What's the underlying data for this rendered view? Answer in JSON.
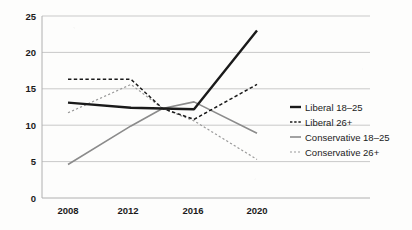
{
  "chart_data": {
    "type": "line",
    "title": "",
    "xlabel": "",
    "ylabel": "",
    "x": [
      2008,
      2010,
      2012,
      2014,
      2016,
      2018,
      2020
    ],
    "categories": [
      "2008",
      "2012",
      "2016",
      "2020"
    ],
    "xtick_labels": [
      "2008",
      "2012",
      "2016",
      "2020"
    ],
    "xtick_values": [
      2008,
      2012,
      2016,
      2020
    ],
    "ytick_labels": [
      "0",
      "5",
      "10",
      "15",
      "20",
      "25"
    ],
    "ytick_values": [
      0,
      5,
      10,
      15,
      20,
      25
    ],
    "ylim": [
      0,
      25
    ],
    "xlim": [
      2007,
      2022
    ],
    "grid": "horizontal",
    "legend_position": "right",
    "series": [
      {
        "name": "Liberal 18–25",
        "style": "solid-thick",
        "color": "#1a1a1a",
        "x": [
          2008,
          2012,
          2014,
          2016,
          2020
        ],
        "values": [
          13.1,
          12.4,
          12.3,
          12.2,
          23.0
        ]
      },
      {
        "name": "Liberal 26+",
        "style": "dashed",
        "color": "#1a1a1a",
        "x": [
          2008,
          2012,
          2014,
          2016,
          2020
        ],
        "values": [
          16.3,
          16.3,
          12.3,
          10.8,
          15.6
        ]
      },
      {
        "name": "Conservative 18–25",
        "style": "solid-thin",
        "color": "#8b8b8b",
        "x": [
          2008,
          2012,
          2014,
          2016,
          2020
        ],
        "values": [
          4.6,
          9.9,
          12.3,
          13.2,
          8.9
        ]
      },
      {
        "name": "Conservative 26+",
        "style": "dotted",
        "color": "#9a9a9a",
        "x": [
          2008,
          2012,
          2014,
          2016,
          2020
        ],
        "values": [
          11.7,
          15.6,
          12.3,
          10.6,
          5.3
        ]
      }
    ],
    "legend": [
      {
        "label": "Liberal 18–25",
        "style": "solid-thick",
        "color": "#1a1a1a"
      },
      {
        "label": "Liberal 26+",
        "style": "dashed",
        "color": "#1a1a1a"
      },
      {
        "label": "Conservative 18–25",
        "style": "solid-thin",
        "color": "#8b8b8b"
      },
      {
        "label": "Conservative 26+",
        "style": "dotted",
        "color": "#9a9a9a"
      }
    ]
  },
  "axes": {
    "y_ticks": [
      {
        "label": "25",
        "py": 16
      },
      {
        "label": "20",
        "py": 52.4
      },
      {
        "label": "15",
        "py": 88.8
      },
      {
        "label": "10",
        "py": 125.2
      },
      {
        "label": "5",
        "py": 161.6
      },
      {
        "label": "0",
        "py": 198
      }
    ],
    "x_ticks": [
      {
        "label": "2008",
        "px": 68
      },
      {
        "label": "2012",
        "px": 128
      },
      {
        "label": "2016",
        "px": 193
      },
      {
        "label": "2020",
        "px": 257
      }
    ]
  },
  "legend_rows": [
    {
      "label": "Liberal 18–25",
      "y": 110
    },
    {
      "label": "Liberal 26+",
      "y": 125
    },
    {
      "label": "Conservative 18–25",
      "y": 140
    },
    {
      "label": "Conservative 26+",
      "y": 155
    }
  ],
  "colors": {
    "ink": "#1a1a1a",
    "gray_line": "#8b8b8b",
    "gray_dotted": "#9a9a9a",
    "grid": "#c9c9c9",
    "axis": "#b0b0b0",
    "background": "#fdfdfc"
  }
}
